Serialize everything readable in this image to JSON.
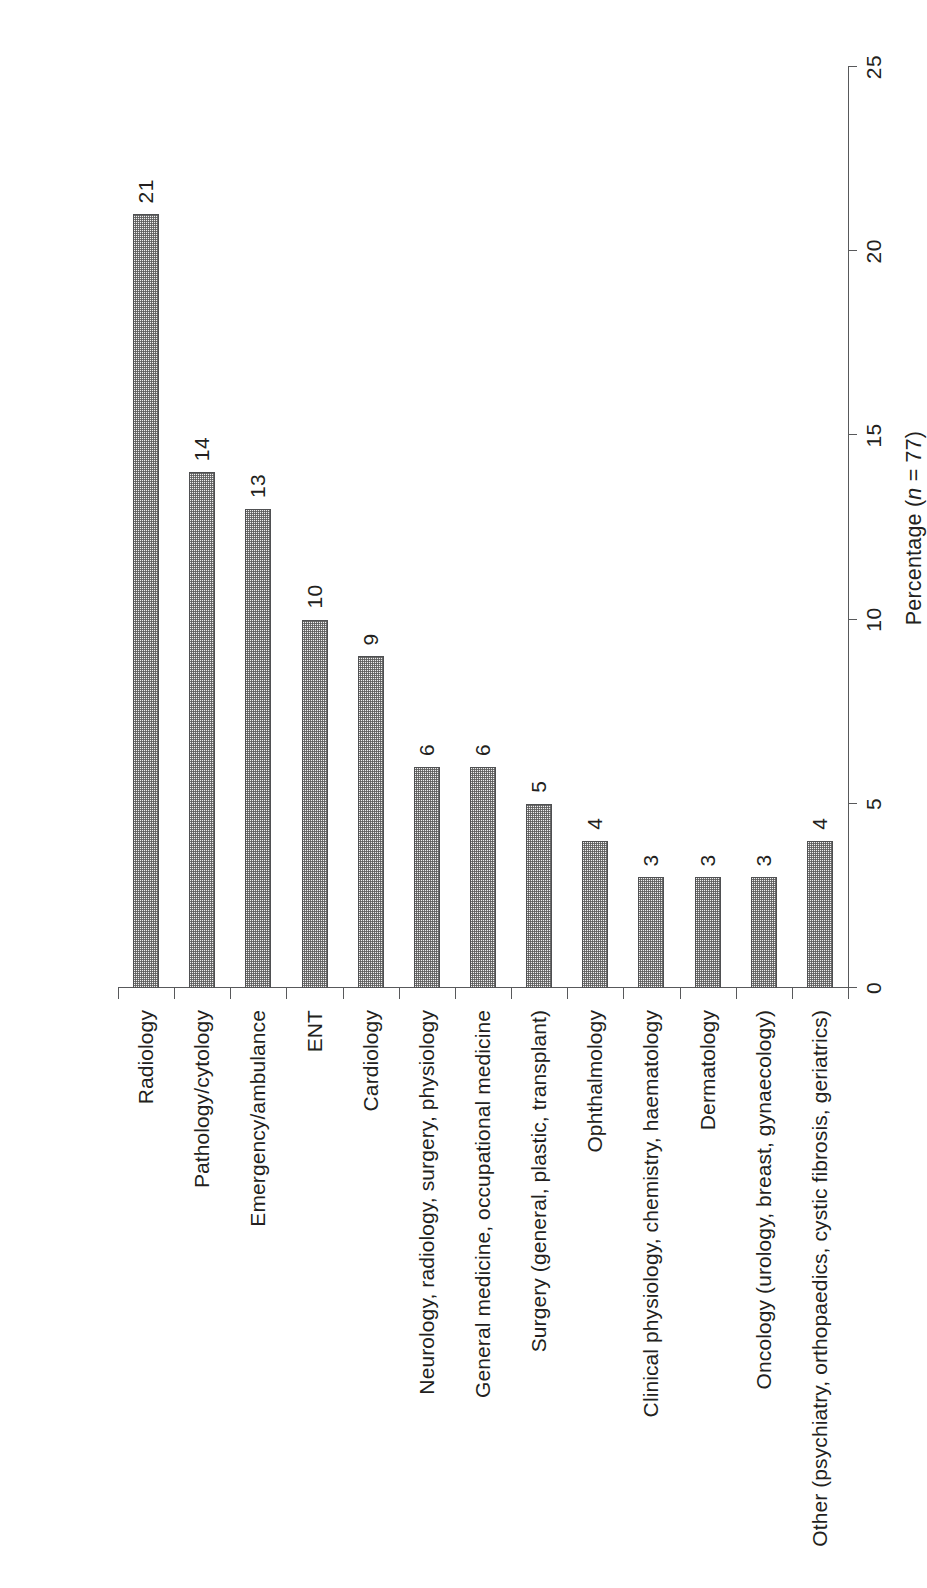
{
  "chart_data": {
    "type": "bar",
    "orientation": "vertical-bars-rotated-90",
    "title": "",
    "subtitle": "",
    "xlabel": "",
    "ylabel": "Percentage (n = 77)",
    "ylabel_parts": {
      "prefix": "Percentage (",
      "italic": "n",
      "suffix": " = 77)"
    },
    "ylim": [
      0,
      25
    ],
    "grid": false,
    "legend": null,
    "tick_labels": [
      "0",
      "5",
      "10",
      "15",
      "20",
      "25"
    ],
    "tick_values": [
      0,
      5,
      10,
      15,
      20,
      25
    ],
    "categories": [
      "Radiology",
      "Pathology/cytology",
      "Emergency/ambulance",
      "ENT",
      "Cardiology",
      "Neurology, radiology, surgery, physiology",
      "General medicine, occupational medicine",
      "Surgery (general, plastic, transplant)",
      "Ophthalmology",
      "Clinical physiology, chemistry, haematology",
      "Dermatology",
      "Oncology (urology, breast, gynaecology)",
      "Other (psychiatry, orthopaedics, cystic fibrosis, geriatrics)"
    ],
    "values": [
      21,
      14,
      13,
      10,
      9,
      6,
      6,
      5,
      4,
      3,
      3,
      3,
      4
    ],
    "data_labels": [
      "21",
      "14",
      "13",
      "10",
      "9",
      "6",
      "6",
      "5",
      "4",
      "3",
      "3",
      "3",
      "4"
    ],
    "bar_fill_color": "#f0f0f0",
    "bar_pattern": "fine-stipple-checker",
    "bar_border_color": "#4f5052",
    "axis_color": "#58595b",
    "text_color": "#231f20",
    "background_color": "#ffffff"
  }
}
